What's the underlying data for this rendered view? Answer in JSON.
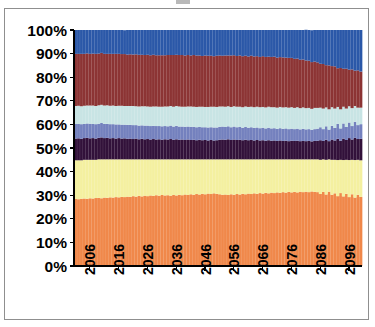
{
  "chart_data": {
    "type": "area",
    "title": "",
    "subtitle": "",
    "xlabel": "",
    "ylabel": "",
    "ylim": [
      0,
      100
    ],
    "xlim": [
      2001,
      2100
    ],
    "grid": false,
    "legend": "none",
    "stacked": true,
    "normalized": true,
    "y_tick_labels": [
      "100%",
      "90%",
      "80%",
      "70%",
      "60%",
      "50%",
      "40%",
      "30%",
      "20%",
      "10%",
      "0%"
    ],
    "y_tick_values": [
      100,
      90,
      80,
      70,
      60,
      50,
      40,
      30,
      20,
      10,
      0
    ],
    "x_tick_labels": [
      "2006",
      "2016",
      "2026",
      "2036",
      "2046",
      "2056",
      "2066",
      "2076",
      "2086",
      "2096"
    ],
    "x_tick_values": [
      2006,
      2016,
      2026,
      2036,
      2046,
      2056,
      2066,
      2076,
      2086,
      2096
    ],
    "colors": {
      "orange": "#F0884A",
      "pale_yellow": "#F4F0A0",
      "dark_purple": "#32113A",
      "periwinkle": "#7481BE",
      "light_cyan": "#C8E4E4",
      "maroon": "#8C3434",
      "blue": "#2B58A8"
    },
    "series": [
      {
        "name": "series-1",
        "color_key": "orange",
        "color": "#F0884A",
        "order": 1,
        "values": [
          28.4,
          28.3,
          28.5,
          28.6,
          28.5,
          28.7,
          28.6,
          28.8,
          28.9,
          28.7,
          29.0,
          28.9,
          29.1,
          29.0,
          29.2,
          29.1,
          29.3,
          29.2,
          29.4,
          29.3,
          29.6,
          29.4,
          29.7,
          29.5,
          29.8,
          29.6,
          29.9,
          29.7,
          30.0,
          29.8,
          30.1,
          29.9,
          30.0,
          29.8,
          30.1,
          29.9,
          30.2,
          30.0,
          30.3,
          30.1,
          30.4,
          30.2,
          30.5,
          30.3,
          30.6,
          30.4,
          30.7,
          30.5,
          30.8,
          30.6,
          30.4,
          30.2,
          30.3,
          30.1,
          30.4,
          30.2,
          30.5,
          30.3,
          30.6,
          30.4,
          30.7,
          30.5,
          30.8,
          30.6,
          30.9,
          30.7,
          31.0,
          30.8,
          31.1,
          30.9,
          31.2,
          31.0,
          31.3,
          31.1,
          31.4,
          31.2,
          31.4,
          31.2,
          31.5,
          31.3,
          31.5,
          31.3,
          31.6,
          31.4,
          31.3,
          30.5,
          31.4,
          30.3,
          31.5,
          30.2,
          30.8,
          29.6,
          30.9,
          29.5,
          30.6,
          29.2,
          30.4,
          29.0,
          30.2,
          29.3
        ]
      },
      {
        "name": "series-2",
        "color_key": "pale_yellow",
        "color": "#F4F0A0",
        "order": 2,
        "values": [
          16.4,
          16.5,
          16.3,
          16.4,
          16.5,
          16.3,
          16.4,
          16.2,
          16.3,
          16.5,
          16.2,
          16.3,
          16.1,
          16.2,
          16.0,
          16.1,
          15.9,
          16.0,
          15.8,
          15.9,
          15.6,
          15.8,
          15.5,
          15.7,
          15.4,
          15.6,
          15.3,
          15.5,
          15.2,
          15.4,
          15.1,
          15.3,
          15.2,
          15.4,
          15.1,
          15.3,
          15.0,
          15.2,
          14.9,
          15.1,
          14.8,
          15.0,
          14.7,
          14.9,
          14.6,
          14.8,
          14.5,
          14.7,
          14.4,
          14.6,
          14.8,
          15.0,
          14.9,
          15.1,
          14.8,
          15.0,
          14.7,
          14.9,
          14.6,
          14.8,
          14.5,
          14.7,
          14.4,
          14.6,
          14.3,
          14.5,
          14.2,
          14.4,
          14.1,
          14.3,
          14.0,
          14.2,
          13.9,
          14.1,
          13.8,
          14.0,
          13.8,
          14.0,
          13.7,
          13.9,
          13.7,
          13.9,
          13.6,
          13.8,
          13.9,
          14.5,
          13.8,
          14.7,
          13.7,
          14.8,
          14.2,
          15.3,
          14.1,
          15.4,
          14.4,
          15.7,
          14.6,
          15.9,
          14.8,
          15.5
        ]
      },
      {
        "name": "series-3",
        "color_key": "dark_purple",
        "color": "#32113A",
        "order": 3,
        "values": [
          9.2,
          9.3,
          9.1,
          9.2,
          9.3,
          9.1,
          9.2,
          9.0,
          9.1,
          9.3,
          9.0,
          9.1,
          8.9,
          9.0,
          8.8,
          9.0,
          8.8,
          8.9,
          8.7,
          8.8,
          8.6,
          8.8,
          8.5,
          8.7,
          8.5,
          8.6,
          8.4,
          8.6,
          8.4,
          8.5,
          8.3,
          8.5,
          8.4,
          8.6,
          8.3,
          8.5,
          8.3,
          8.4,
          8.2,
          8.4,
          8.2,
          8.3,
          8.1,
          8.3,
          8.1,
          8.2,
          8.0,
          8.2,
          8.0,
          8.1,
          8.3,
          8.4,
          8.3,
          8.5,
          8.2,
          8.4,
          8.2,
          8.3,
          8.1,
          8.3,
          8.1,
          8.2,
          8.0,
          8.2,
          8.0,
          8.1,
          7.9,
          8.1,
          7.9,
          8.0,
          7.8,
          8.0,
          7.8,
          7.9,
          7.7,
          7.9,
          7.8,
          7.9,
          7.7,
          7.8,
          7.7,
          7.8,
          7.6,
          7.8,
          7.9,
          8.3,
          7.8,
          8.5,
          7.7,
          8.6,
          8.2,
          9.0,
          8.1,
          9.1,
          8.4,
          9.3,
          8.6,
          9.4,
          8.8,
          9.1
        ]
      },
      {
        "name": "series-4",
        "color_key": "periwinkle",
        "color": "#7481BE",
        "order": 4,
        "values": [
          6.2,
          6.1,
          6.2,
          6.0,
          6.1,
          6.2,
          6.0,
          6.1,
          6.0,
          6.1,
          6.0,
          5.9,
          6.0,
          5.9,
          6.0,
          5.8,
          5.9,
          5.8,
          5.9,
          5.8,
          5.9,
          5.7,
          5.8,
          5.7,
          5.8,
          5.7,
          5.7,
          5.6,
          5.7,
          5.6,
          5.7,
          5.6,
          5.6,
          5.7,
          5.6,
          5.7,
          5.6,
          5.5,
          5.6,
          5.5,
          5.6,
          5.5,
          5.5,
          5.4,
          5.5,
          5.4,
          5.5,
          5.4,
          5.5,
          5.4,
          5.5,
          5.5,
          5.4,
          5.5,
          5.4,
          5.5,
          5.4,
          5.4,
          5.3,
          5.4,
          5.3,
          5.4,
          5.3,
          5.3,
          5.2,
          5.3,
          5.2,
          5.3,
          5.2,
          5.2,
          5.1,
          5.2,
          5.1,
          5.2,
          5.1,
          5.1,
          5.0,
          5.1,
          5.0,
          5.1,
          5.0,
          5.0,
          4.9,
          5.0,
          5.1,
          5.5,
          5.0,
          5.7,
          4.9,
          5.8,
          5.3,
          6.3,
          5.2,
          6.4,
          5.5,
          6.6,
          5.7,
          6.8,
          5.9,
          6.2
        ]
      },
      {
        "name": "series-5",
        "color_key": "light_cyan",
        "color": "#C8E4E4",
        "order": 5,
        "values": [
          7.6,
          7.7,
          7.6,
          7.7,
          7.6,
          7.7,
          7.8,
          7.7,
          7.8,
          7.7,
          7.8,
          7.9,
          7.8,
          7.9,
          7.8,
          7.9,
          8.0,
          7.9,
          8.0,
          8.0,
          8.1,
          8.0,
          8.1,
          8.1,
          8.2,
          8.1,
          8.2,
          8.2,
          8.3,
          8.2,
          8.3,
          8.3,
          8.4,
          8.3,
          8.4,
          8.4,
          8.5,
          8.4,
          8.5,
          8.5,
          8.6,
          8.5,
          8.6,
          8.6,
          8.7,
          8.6,
          8.7,
          8.7,
          8.8,
          8.7,
          8.6,
          8.5,
          8.6,
          8.5,
          8.6,
          8.6,
          8.7,
          8.6,
          8.7,
          8.7,
          8.8,
          8.7,
          8.8,
          8.8,
          8.9,
          8.8,
          8.9,
          8.9,
          9.0,
          8.9,
          9.0,
          9.0,
          9.1,
          9.0,
          9.1,
          9.1,
          9.0,
          9.1,
          9.0,
          9.1,
          9.0,
          9.0,
          8.9,
          9.0,
          8.8,
          8.3,
          8.7,
          8.0,
          8.6,
          7.9,
          8.2,
          7.2,
          8.1,
          7.1,
          7.8,
          6.9,
          7.6,
          6.7,
          7.4,
          7.0
        ]
      },
      {
        "name": "series-6",
        "color_key": "maroon",
        "color": "#8C3434",
        "order": 6,
        "values": [
          22.1,
          22.0,
          22.2,
          22.0,
          22.1,
          21.9,
          22.0,
          22.1,
          21.9,
          22.0,
          21.9,
          21.8,
          22.0,
          21.9,
          22.1,
          22.0,
          21.9,
          22.0,
          21.8,
          21.9,
          21.8,
          22.0,
          21.9,
          21.8,
          21.7,
          21.9,
          21.8,
          21.9,
          21.7,
          21.8,
          21.8,
          21.7,
          21.8,
          21.6,
          21.9,
          21.7,
          21.8,
          21.9,
          21.7,
          21.8,
          21.6,
          21.9,
          21.8,
          21.7,
          21.5,
          21.8,
          21.7,
          21.6,
          21.4,
          21.7,
          21.6,
          21.5,
          21.7,
          21.5,
          21.8,
          21.6,
          21.5,
          21.7,
          21.6,
          21.5,
          21.4,
          21.6,
          21.5,
          21.4,
          21.3,
          21.5,
          21.4,
          21.2,
          21.3,
          21.4,
          21.2,
          21.1,
          21.2,
          21.0,
          21.1,
          20.9,
          20.8,
          20.6,
          20.5,
          20.3,
          20.2,
          20.0,
          19.8,
          19.6,
          19.3,
          18.6,
          18.9,
          17.9,
          18.6,
          17.4,
          17.9,
          16.4,
          17.5,
          16.1,
          16.9,
          15.5,
          16.4,
          15.0,
          15.8,
          15.3
        ]
      },
      {
        "name": "series-7",
        "color_key": "blue",
        "color": "#2B58A8",
        "order": 7,
        "values": [
          10.1,
          10.1,
          10.1,
          10.1,
          9.9,
          10.1,
          10.0,
          10.1,
          10.0,
          9.7,
          10.1,
          10.1,
          10.1,
          10.1,
          10.1,
          10.1,
          10.2,
          10.1,
          10.4,
          10.3,
          10.4,
          10.3,
          10.5,
          10.5,
          10.6,
          10.5,
          10.7,
          10.5,
          10.7,
          10.7,
          10.7,
          10.7,
          10.6,
          10.6,
          10.6,
          10.5,
          10.6,
          10.6,
          10.8,
          10.6,
          10.8,
          10.6,
          10.8,
          10.8,
          11.0,
          10.8,
          10.9,
          10.9,
          11.1,
          10.9,
          10.8,
          10.9,
          10.8,
          10.8,
          10.8,
          10.7,
          11.0,
          10.8,
          11.1,
          10.9,
          11.2,
          10.9,
          11.2,
          11.1,
          11.4,
          11.1,
          11.4,
          11.3,
          11.4,
          11.3,
          11.7,
          11.5,
          11.6,
          11.7,
          11.8,
          11.8,
          12.2,
          12.1,
          12.6,
          12.5,
          13.0,
          13.0,
          13.5,
          13.4,
          13.7,
          14.3,
          14.4,
          14.9,
          15.0,
          15.3,
          15.4,
          16.2,
          16.1,
          16.4,
          16.4,
          16.8,
          16.7,
          17.2,
          17.1,
          17.6
        ]
      }
    ]
  },
  "axis": {
    "y_title": "",
    "x_title": ""
  }
}
